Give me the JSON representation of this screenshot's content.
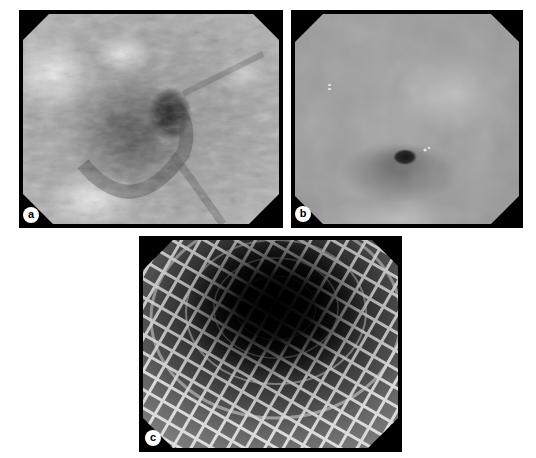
{
  "figure": {
    "panels": [
      {
        "id": "a",
        "label": "a",
        "description": "endoscopic view of narrowed lumen with mucosal folds"
      },
      {
        "id": "b",
        "label": "b",
        "description": "endoscopic view of small pinpoint lumen"
      },
      {
        "id": "c",
        "label": "c",
        "description": "endoscopic view through expanded mesh stent"
      }
    ]
  },
  "colors": {
    "frame": "#000000",
    "label_bg": "#ffffff",
    "label_text": "#000000"
  }
}
